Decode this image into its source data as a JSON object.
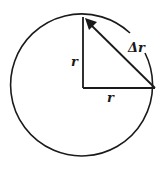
{
  "diagram": {
    "type": "vector-circle-diagram",
    "labels": {
      "vertical_radius": "r",
      "horizontal_radius": "r",
      "chord": "Δr"
    },
    "colors": {
      "stroke": "#1a1a1a",
      "background": "#ffffff"
    }
  }
}
